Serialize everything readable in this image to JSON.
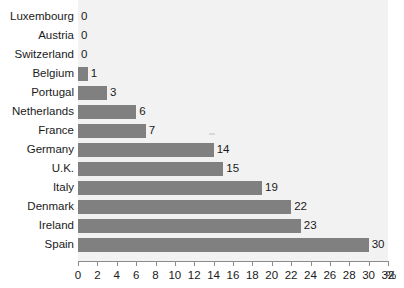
{
  "chart_data": {
    "type": "bar",
    "orientation": "horizontal",
    "title": "",
    "subtitle": "",
    "xlabel": "%",
    "ylabel": "",
    "xlim": [
      0,
      32
    ],
    "xticks": [
      0,
      2,
      4,
      6,
      8,
      10,
      12,
      14,
      16,
      18,
      20,
      22,
      24,
      26,
      28,
      30,
      32
    ],
    "xtick_labels": [
      "0",
      "2",
      "4",
      "6",
      "8",
      "10",
      "12",
      "14",
      "16",
      "18",
      "20",
      "22",
      "24",
      "26",
      "28",
      "30",
      "32"
    ],
    "grid": false,
    "legend": null,
    "categories": [
      "Luxembourg",
      "Austria",
      "Switzerland",
      "Belgium",
      "Portugal",
      "Netherlands",
      "France",
      "Germany",
      "U.K.",
      "Italy",
      "Denmark",
      "Ireland",
      "Spain"
    ],
    "values": [
      0,
      0,
      0,
      1,
      3,
      6,
      7,
      14,
      15,
      19,
      22,
      23,
      30
    ],
    "value_labels": [
      "0",
      "0",
      "0",
      "1",
      "3",
      "6",
      "7",
      "14",
      "15",
      "19",
      "22",
      "23",
      "30"
    ],
    "bar_color": "#808080",
    "plot_background": "#f2f2f2",
    "page_background": "#ffffff",
    "axis_color": "#8c8c8c",
    "text_color": "#1a1a1a"
  }
}
